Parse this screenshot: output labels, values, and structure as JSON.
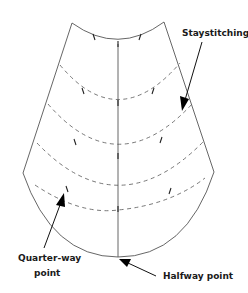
{
  "diagram": {
    "type": "sewing-pattern-piece",
    "labels": {
      "staystitching": "Staystitching",
      "quarter_way_line1": "Quarter-way",
      "quarter_way_line2": "point",
      "halfway": "Halfway point"
    },
    "staystitch_rows": 4,
    "colors": {
      "line": "#555555",
      "text": "#1a1a1a",
      "arrowhead": "#000000"
    }
  }
}
